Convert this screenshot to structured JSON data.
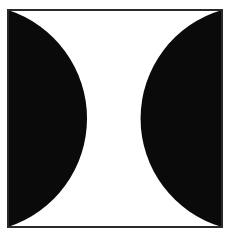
{
  "canvas": {
    "width": 234,
    "height": 237,
    "background_color": "#ffffff",
    "title": "Figure-ground illusion plate"
  },
  "frame": {
    "name": "border-frame",
    "x": 7,
    "y": 9,
    "width": 216,
    "height": 219,
    "stroke_color": "#2a2a2a",
    "stroke_width": 2,
    "fill_color": "#ffffff"
  },
  "figure": {
    "type": "bistable-figure-ground",
    "black_color": "#0a0a0a",
    "white_color": "#ffffff",
    "shapes": [
      {
        "name": "left-black-segment",
        "anchor_edge": "left",
        "chord_x": 8,
        "apex_x": 87,
        "apex_y": 118,
        "top_y": 10,
        "bottom_y": 227,
        "sagitta": 79,
        "arc_radius": 114,
        "fill": "#0a0a0a"
      },
      {
        "name": "right-black-segment",
        "anchor_edge": "right",
        "chord_x": 222,
        "apex_x": 138,
        "apex_y": 118,
        "top_y": 10,
        "bottom_y": 227,
        "sagitta": 84,
        "arc_radius": 113,
        "fill": "#0a0a0a"
      }
    ],
    "negative_space": {
      "name": "white-hourglass",
      "waist_x_left": 87,
      "waist_x_right": 138,
      "waist_y": 118,
      "waist_width": 51,
      "fill": "#ffffff"
    }
  },
  "labels": {
    "alt_text": "Black and white figure-ground illusion: two inward-facing black half-circles inside a thin square border form a white hourglass in the middle."
  }
}
